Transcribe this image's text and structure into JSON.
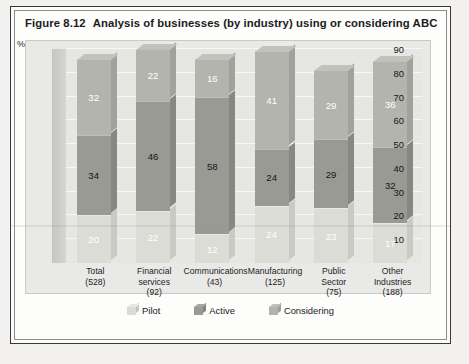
{
  "figure": {
    "number": "Figure 8.12",
    "title": "Analysis of businesses (by industry) using or considering ABC"
  },
  "chart_data": {
    "type": "bar",
    "subtype": "stacked-column-3d",
    "title": "Analysis of businesses (by industry) using or considering ABC",
    "xlabel": "",
    "ylabel": "%",
    "ylim": [
      0,
      90
    ],
    "yticks": [
      10,
      20,
      30,
      40,
      50,
      60,
      70,
      80,
      90
    ],
    "grid": true,
    "legend_position": "bottom",
    "categories": [
      "Total",
      "Financial services",
      "Communications",
      "Manufacturing",
      "Public Sector",
      "Other Industries"
    ],
    "category_lines": [
      [
        "Total",
        "(528)"
      ],
      [
        "Financial",
        "services",
        "(92)"
      ],
      [
        "Communications",
        "(43)"
      ],
      [
        "Manufacturing",
        "(125)"
      ],
      [
        "Public",
        "Sector",
        "(75)"
      ],
      [
        "Other",
        "Industries",
        "(188)"
      ]
    ],
    "sample_sizes": [
      528,
      92,
      43,
      125,
      75,
      188
    ],
    "series": [
      {
        "name": "Pilot",
        "values": [
          20,
          22,
          12,
          24,
          23,
          17
        ],
        "color": "#dcdcd7"
      },
      {
        "name": "Active",
        "values": [
          34,
          46,
          58,
          24,
          29,
          32
        ],
        "color": "#9a9a95"
      },
      {
        "name": "Considering",
        "values": [
          32,
          22,
          16,
          41,
          29,
          36
        ],
        "color": "#b4b4ae"
      }
    ],
    "stack_order": [
      "Pilot",
      "Active",
      "Considering"
    ],
    "totals": [
      86,
      90,
      86,
      89,
      81,
      85
    ]
  },
  "axis": {
    "percent_symbol": "%",
    "tick_90": "90",
    "tick_80": "80",
    "tick_70": "70",
    "tick_60": "60",
    "tick_50": "50",
    "tick_40": "40",
    "tick_30": "30",
    "tick_20": "20",
    "tick_10": "10"
  },
  "legend": {
    "items": [
      {
        "label": "Pilot",
        "color": "#dcdcd7"
      },
      {
        "label": "Active",
        "color": "#9a9a95"
      },
      {
        "label": "Considering",
        "color": "#b4b4ae"
      }
    ]
  },
  "labels": {
    "b0": {
      "pilot": "20",
      "active": "34",
      "considering": "32"
    },
    "b1": {
      "pilot": "22",
      "active": "46",
      "considering": "22"
    },
    "b2": {
      "pilot": "12",
      "active": "58",
      "considering": "16"
    },
    "b3": {
      "pilot": "24",
      "active": "24",
      "considering": "41"
    },
    "b4": {
      "pilot": "23",
      "active": "29",
      "considering": "29"
    },
    "b5": {
      "pilot": "17",
      "active": "32",
      "considering": "36"
    }
  },
  "xlabels": {
    "c0l1": "Total",
    "c0l2": "(528)",
    "c0l3": "",
    "c1l1": "Financial",
    "c1l2": "services",
    "c1l3": "(92)",
    "c2l1": "Communications",
    "c2l2": "(43)",
    "c2l3": "",
    "c3l1": "Manufacturing",
    "c3l2": "(125)",
    "c3l3": "",
    "c4l1": "Public",
    "c4l2": "Sector",
    "c4l3": "(75)",
    "c5l1": "Other",
    "c5l2": "Industries",
    "c5l3": "(188)"
  }
}
